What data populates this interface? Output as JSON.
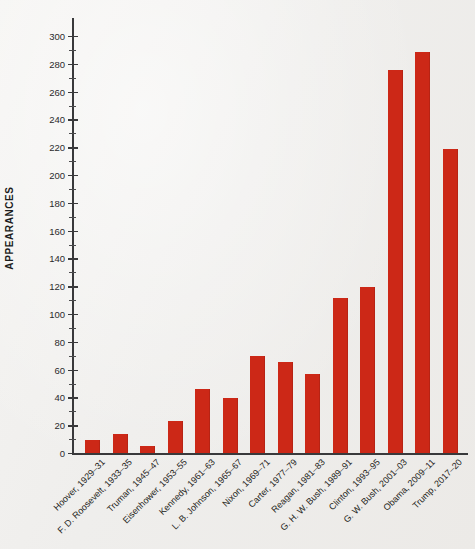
{
  "chart_data": {
    "type": "bar",
    "title": "",
    "xlabel": "",
    "ylabel": "APPEARANCES",
    "ylim": [
      0,
      300
    ],
    "ytick_step": 20,
    "yminor_step": 10,
    "grid": false,
    "legend": false,
    "bar_color": "#cc2817",
    "background_color": "#f2f1ef",
    "axis_color": "#39393b",
    "categories": [
      "Hoover, 1929–31",
      "F. D. Roosevelt, 1933–35",
      "Truman, 1945–47",
      "Eisenhower, 1953–55",
      "Kennedy, 1961–63",
      "L. B. Johnson, 1965–67",
      "Nixon, 1969–71",
      "Carter, 1977–79",
      "Reagan, 1981–83",
      "G. H. W. Bush, 1989–91",
      "Clinton, 1993–95",
      "G. W. Bush, 2001–03",
      "Obama, 2009–11",
      "Trump, 2017–20"
    ],
    "values": [
      10,
      14,
      5,
      23,
      46,
      40,
      70,
      66,
      57,
      112,
      120,
      276,
      289,
      219
    ],
    "ytick_labels": [
      "0",
      "20",
      "40",
      "60",
      "80",
      "100",
      "120",
      "140",
      "160",
      "180",
      "200",
      "220",
      "240",
      "260",
      "280",
      "300"
    ],
    "ytick_values": [
      0,
      20,
      40,
      60,
      80,
      100,
      120,
      140,
      160,
      180,
      200,
      220,
      240,
      260,
      280,
      300
    ]
  }
}
